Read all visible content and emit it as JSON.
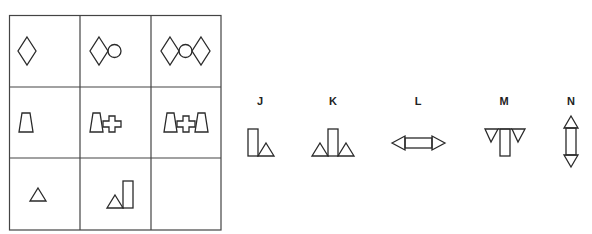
{
  "puzzle": {
    "type": "matrix-completion",
    "grid": {
      "rows": 3,
      "cols": 3,
      "cells": [
        {
          "row": 1,
          "col": 1,
          "content": "diamond"
        },
        {
          "row": 1,
          "col": 2,
          "content": "diamond + circle"
        },
        {
          "row": 1,
          "col": 3,
          "content": "diamond + circle + diamond"
        },
        {
          "row": 2,
          "col": 1,
          "content": "trapezoid"
        },
        {
          "row": 2,
          "col": 2,
          "content": "trapezoid + cross"
        },
        {
          "row": 2,
          "col": 3,
          "content": "trapezoid + cross + trapezoid"
        },
        {
          "row": 3,
          "col": 1,
          "content": "triangle"
        },
        {
          "row": 3,
          "col": 2,
          "content": "triangle + tall rectangle"
        },
        {
          "row": 3,
          "col": 3,
          "content": "empty (missing)"
        }
      ]
    },
    "options": [
      {
        "label": "J",
        "content": "tall rectangle + triangle"
      },
      {
        "label": "K",
        "content": "triangle + tall rectangle + triangle"
      },
      {
        "label": "L",
        "content": "horizontal rectangle with triangles pointing left and right"
      },
      {
        "label": "M",
        "content": "vertical rectangle with inverted triangles on both sides at top"
      },
      {
        "label": "N",
        "content": "vertical rectangle with triangles pointing up and down"
      }
    ]
  },
  "colors": {
    "stroke": "#2a2a2a",
    "grid": "#444444",
    "background": "#ffffff"
  }
}
